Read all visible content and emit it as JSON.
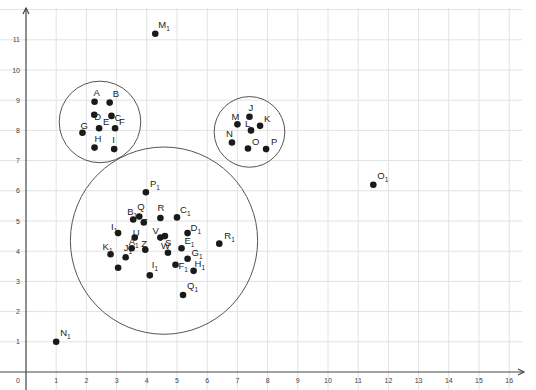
{
  "chart_data": {
    "type": "scatter",
    "title": "",
    "xlabel": "",
    "ylabel": "",
    "xlim": [
      0,
      16.5
    ],
    "ylim": [
      0,
      11.8
    ],
    "grid": true,
    "legend": "none",
    "x_ticks": [
      0,
      1,
      2,
      3,
      4,
      5,
      6,
      7,
      8,
      9,
      10,
      11,
      12,
      13,
      14,
      15,
      16
    ],
    "y_ticks": [
      1,
      2,
      3,
      4,
      5,
      6,
      7,
      8,
      9,
      10,
      11
    ],
    "origin_label": "0",
    "points": [
      {
        "name": "A",
        "x": 2.27,
        "y": 8.95
      },
      {
        "name": "B",
        "x": 2.77,
        "y": 8.92
      },
      {
        "name": "C",
        "x": 2.83,
        "y": 8.48
      },
      {
        "name": "D",
        "x": 2.26,
        "y": 8.52
      },
      {
        "name": "E",
        "x": 2.42,
        "y": 8.07
      },
      {
        "name": "F",
        "x": 2.95,
        "y": 8.07
      },
      {
        "name": "G",
        "x": 1.87,
        "y": 7.92
      },
      {
        "name": "H",
        "x": 2.27,
        "y": 7.43
      },
      {
        "name": "I",
        "x": 2.92,
        "y": 7.38
      },
      {
        "name": "J",
        "x": 7.4,
        "y": 8.45
      },
      {
        "name": "K",
        "x": 7.75,
        "y": 8.15
      },
      {
        "name": "L",
        "x": 7.45,
        "y": 8.0
      },
      {
        "name": "M",
        "x": 7.0,
        "y": 8.2
      },
      {
        "name": "N",
        "x": 6.82,
        "y": 7.6
      },
      {
        "name": "O",
        "x": 7.35,
        "y": 7.4
      },
      {
        "name": "P",
        "x": 7.95,
        "y": 7.38
      },
      {
        "name": "M1",
        "x": 4.28,
        "y": 11.2
      },
      {
        "name": "N1",
        "x": 1.0,
        "y": 1.0
      },
      {
        "name": "O1",
        "x": 11.5,
        "y": 6.2
      },
      {
        "name": "P1",
        "x": 3.97,
        "y": 5.95
      },
      {
        "name": "Q",
        "x": 3.75,
        "y": 5.15
      },
      {
        "name": "R",
        "x": 4.45,
        "y": 5.1
      },
      {
        "name": "C1",
        "x": 5.0,
        "y": 5.12
      },
      {
        "name": "B1",
        "x": 3.55,
        "y": 5.05
      },
      {
        "name": "T",
        "x": 3.9,
        "y": 4.95
      },
      {
        "name": "I1",
        "x": 3.05,
        "y": 4.6
      },
      {
        "name": "U",
        "x": 3.6,
        "y": 4.45
      },
      {
        "name": "S",
        "x": 4.6,
        "y": 4.5
      },
      {
        "name": "D1",
        "x": 5.35,
        "y": 4.6
      },
      {
        "name": "V",
        "x": 4.45,
        "y": 4.45
      },
      {
        "name": "A1",
        "x": 3.5,
        "y": 4.1
      },
      {
        "name": "Z",
        "x": 3.95,
        "y": 4.05
      },
      {
        "name": "K1",
        "x": 2.8,
        "y": 3.9
      },
      {
        "name": "W",
        "x": 4.7,
        "y": 3.95
      },
      {
        "name": "E1",
        "x": 5.15,
        "y": 4.1
      },
      {
        "name": "J1",
        "x": 3.3,
        "y": 3.8
      },
      {
        "name": "G1",
        "x": 5.35,
        "y": 3.75
      },
      {
        "name": "F1",
        "x": 4.95,
        "y": 3.55
      },
      {
        "name": "H1",
        "x": 5.55,
        "y": 3.35
      },
      {
        "name": "I1b",
        "x": 4.1,
        "y": 3.2
      },
      {
        "name": "Q1",
        "x": 5.2,
        "y": 2.55
      },
      {
        "name": "R1",
        "x": 6.4,
        "y": 4.25
      },
      {
        "name": "L1",
        "x": 3.05,
        "y": 3.45
      }
    ],
    "clusters": [
      {
        "cx": 2.45,
        "cy": 8.28,
        "r": 1.35
      },
      {
        "cx": 7.4,
        "cy": 7.95,
        "r": 1.17
      },
      {
        "cx": 4.57,
        "cy": 4.35,
        "r": 3.1
      }
    ]
  },
  "labels": {
    "origin": "0",
    "x_ticks": [
      "1",
      "2",
      "3",
      "4",
      "5",
      "6",
      "7",
      "8",
      "9",
      "10",
      "11",
      "12",
      "13",
      "14",
      "15",
      "16"
    ],
    "y_ticks": [
      "1",
      "2",
      "3",
      "4",
      "5",
      "6",
      "7",
      "8",
      "9",
      "10",
      "11"
    ]
  }
}
